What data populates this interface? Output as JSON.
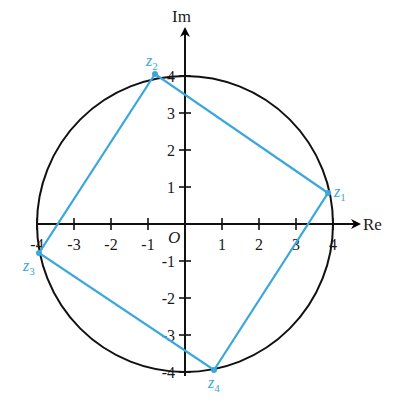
{
  "diagram": {
    "type": "complex-plane",
    "axes": {
      "x_label": "Re",
      "y_label": "Im",
      "origin_label": "O",
      "x_ticks": [
        "-4",
        "-3",
        "-2",
        "-1",
        "1",
        "2",
        "3",
        "4"
      ],
      "y_ticks": [
        "4",
        "3",
        "2",
        "1",
        "-1",
        "-2",
        "-3",
        "-4"
      ]
    },
    "circle": {
      "radius": 4,
      "color": "#000000"
    },
    "square": {
      "color": "#3aa7dc",
      "vertices": [
        {
          "name": "z",
          "sub": "1",
          "re": 3.9,
          "im": 0.85
        },
        {
          "name": "z",
          "sub": "2",
          "re": -0.85,
          "im": 3.9
        },
        {
          "name": "z",
          "sub": "3",
          "re": -3.9,
          "im": -0.85
        },
        {
          "name": "z",
          "sub": "4",
          "re": 0.85,
          "im": -3.9
        }
      ]
    }
  }
}
